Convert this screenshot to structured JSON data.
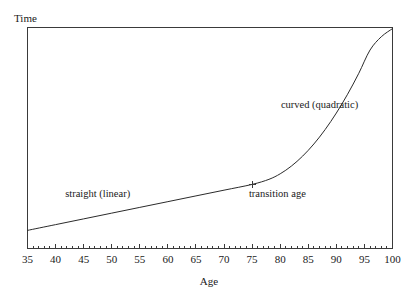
{
  "chart_data": {
    "type": "line",
    "title": "",
    "xlabel": "Age",
    "ylabel": "Time",
    "xlim": [
      35,
      100
    ],
    "ylim": [
      0,
      10
    ],
    "grid": false,
    "legend": "none",
    "x_ticks": [
      35,
      40,
      45,
      50,
      55,
      60,
      65,
      70,
      75,
      80,
      85,
      90,
      95,
      100
    ],
    "x_tick_labels": [
      "35",
      "40",
      "45",
      "50",
      "55",
      "60",
      "65",
      "70",
      "75",
      "80",
      "85",
      "90",
      "95",
      "100"
    ],
    "x_minor_ticks_between": 4,
    "y_ticks": [],
    "y_tick_labels": [],
    "series": [
      {
        "name": "piecewise linear-quadratic",
        "x": [
          35,
          40,
          45,
          50,
          55,
          60,
          65,
          70,
          75,
          78,
          80,
          82,
          84,
          86,
          88,
          90,
          92,
          94,
          96,
          98,
          100
        ],
        "y": [
          0.82,
          1.08,
          1.34,
          1.6,
          1.86,
          2.12,
          2.38,
          2.64,
          2.9,
          3.13,
          3.38,
          3.73,
          4.18,
          4.73,
          5.38,
          6.13,
          6.98,
          7.93,
          8.98,
          9.58,
          9.95
        ]
      }
    ],
    "transition_point": {
      "x": 75,
      "y": 2.9,
      "marker": "plus"
    },
    "annotations": [
      {
        "name": "linear-segment-label",
        "text": "straight (linear)",
        "x": 47.5,
        "y": 2.35
      },
      {
        "name": "transition-age-label",
        "text": "transition age",
        "x": 79.5,
        "y": 2.35
      },
      {
        "name": "quadratic-segment-label",
        "text": "curved (quadratic)",
        "x": 87.0,
        "y": 6.35
      }
    ],
    "colors": {
      "curve": "#2b2b2b",
      "axis": "#3a3a3a",
      "text": "#1a1a1a",
      "background": "#ffffff"
    }
  }
}
